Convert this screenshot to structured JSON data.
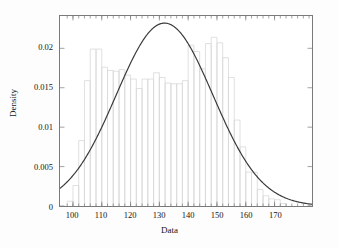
{
  "chart_data": {
    "type": "bar",
    "title": "",
    "subtitle": "",
    "xlabel": "Data",
    "ylabel": "Density",
    "xlim": [
      95.5,
      183.0
    ],
    "ylim": [
      0,
      0.0241
    ],
    "grid": false,
    "legend": null,
    "x_ticks": [
      100,
      110,
      120,
      130,
      140,
      150,
      160,
      170
    ],
    "x_tick_labels": [
      "100",
      "110",
      "120",
      "130",
      "140",
      "150",
      "160",
      "170"
    ],
    "y_ticks": [
      0,
      0.005,
      0.01,
      0.015,
      0.02
    ],
    "y_tick_labels": [
      "0",
      "0.005",
      "0.01",
      "0.015",
      "0.02"
    ],
    "bin_width": 2,
    "bin_edges": [
      98,
      100,
      102,
      104,
      106,
      108,
      110,
      112,
      114,
      116,
      118,
      120,
      122,
      124,
      126,
      128,
      130,
      132,
      134,
      136,
      138,
      140,
      142,
      144,
      146,
      148,
      150,
      152,
      154,
      156,
      158,
      160,
      162,
      164,
      166,
      168,
      170,
      172,
      174
    ],
    "bin_centers": [
      99,
      101,
      103,
      105,
      107,
      109,
      111,
      113,
      115,
      117,
      119,
      121,
      123,
      125,
      127,
      129,
      131,
      133,
      135,
      137,
      139,
      141,
      143,
      145,
      147,
      149,
      151,
      153,
      155,
      157,
      159,
      161,
      163,
      165,
      167,
      169,
      171,
      173
    ],
    "values": [
      0.0006,
      0.0026,
      0.0083,
      0.0159,
      0.0199,
      0.0199,
      0.0176,
      0.0172,
      0.0171,
      0.0173,
      0.0166,
      0.0161,
      0.0149,
      0.0161,
      0.0161,
      0.0169,
      0.0163,
      0.0156,
      0.0155,
      0.0155,
      0.0159,
      0.0204,
      0.0196,
      0.0174,
      0.0206,
      0.0214,
      0.0207,
      0.0188,
      0.0163,
      0.0109,
      0.0075,
      0.0043,
      0.0043,
      0.0021,
      0.0013,
      0.0009,
      0.0008,
      0.0003
    ],
    "series": [
      {
        "name": "histogram",
        "type": "bar",
        "color": "#d8d8d8",
        "fill": "none",
        "values": [
          0.0006,
          0.0026,
          0.0083,
          0.0159,
          0.0199,
          0.0199,
          0.0176,
          0.0172,
          0.0171,
          0.0173,
          0.0166,
          0.0161,
          0.0149,
          0.0161,
          0.0161,
          0.0169,
          0.0163,
          0.0156,
          0.0155,
          0.0155,
          0.0159,
          0.0204,
          0.0196,
          0.0174,
          0.0206,
          0.0214,
          0.0207,
          0.0188,
          0.0163,
          0.0109,
          0.0075,
          0.0043,
          0.0043,
          0.0021,
          0.0013,
          0.0009,
          0.0008,
          0.0003
        ]
      },
      {
        "name": "normal-density-fit",
        "type": "line",
        "color": "#3a3a3a",
        "mean": 131.8,
        "stddev": 16.8,
        "peak_x": 132,
        "peak_y": 0.0232,
        "x": [
          95.5,
          99,
          103,
          107,
          111,
          115,
          119,
          123,
          127,
          131,
          132,
          135,
          139,
          143,
          147,
          151,
          155,
          159,
          163,
          167,
          171,
          175,
          179,
          183
        ],
        "y": [
          0.0024,
          0.0036,
          0.0053,
          0.0075,
          0.0102,
          0.0133,
          0.0164,
          0.0193,
          0.0216,
          0.0231,
          0.0232,
          0.0228,
          0.0213,
          0.0189,
          0.016,
          0.0128,
          0.0098,
          0.007,
          0.0048,
          0.003,
          0.0018,
          0.001,
          0.0006,
          0.0003
        ]
      }
    ]
  },
  "axes": {
    "x_title": "Data",
    "y_title": "Density"
  },
  "colors": {
    "background": "#fdfdfd",
    "plot_background": "#ffffff",
    "frame": "#7a7a7a",
    "bar_stroke": "#d8d8d8",
    "curve": "#3a3a3a",
    "text": "#151515"
  }
}
